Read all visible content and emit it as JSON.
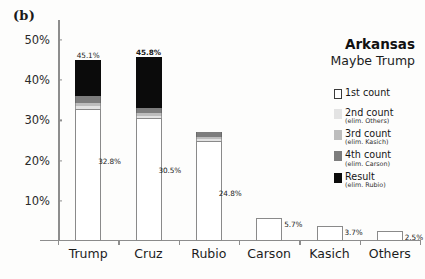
{
  "panel": {
    "label": "(b)"
  },
  "title": {
    "main": "Arkansas",
    "sub": "Maybe Trump"
  },
  "legend": {
    "items": [
      {
        "name": "1st count",
        "sub": "",
        "swatch": "#ffffff"
      },
      {
        "name": "2nd count",
        "sub": "(elim. Others)",
        "swatch": "#e3e3e3"
      },
      {
        "name": "3rd count",
        "sub": "(elim. Kasich)",
        "swatch": "#bdbdbd"
      },
      {
        "name": "4th count",
        "sub": "(elim. Carson)",
        "swatch": "#7d7d7d"
      },
      {
        "name": "Result",
        "sub": "(elim. Rubio)",
        "swatch": "#0b0b0b"
      }
    ]
  },
  "chart_data": {
    "type": "bar",
    "title": "Arkansas",
    "subtitle": "Maybe Trump",
    "xlabel": "",
    "ylabel": "",
    "ylim": [
      0,
      55
    ],
    "grid": false,
    "stacked": true,
    "legend_position": "right",
    "ytick_labels": [
      "10%",
      "20%",
      "30%",
      "40%",
      "50%"
    ],
    "ytick_values": [
      10,
      20,
      30,
      40,
      50
    ],
    "categories": [
      "Trump",
      "Cruz",
      "Rubio",
      "Carson",
      "Kasich",
      "Others"
    ],
    "series": [
      {
        "name": "1st count",
        "values": [
          32.8,
          30.5,
          24.8,
          5.7,
          3.7,
          2.5
        ]
      },
      {
        "name": "2nd count",
        "values": [
          33.6,
          31.1,
          25.3,
          0,
          0,
          0
        ]
      },
      {
        "name": "3rd count",
        "values": [
          34.4,
          31.8,
          25.9,
          0,
          0,
          0
        ]
      },
      {
        "name": "4th count",
        "values": [
          36.0,
          33.0,
          27.2,
          0,
          0,
          0
        ]
      },
      {
        "name": "Result",
        "values": [
          45.1,
          45.8,
          0,
          0,
          0,
          0
        ]
      }
    ],
    "bar_labels_top": [
      "45.1%",
      "45.8%",
      "",
      "5.7%",
      "3.7%",
      "2.5%"
    ],
    "bar_labels_inner": [
      "32.8%",
      "30.5%",
      "24.8%",
      "",
      "",
      ""
    ]
  }
}
